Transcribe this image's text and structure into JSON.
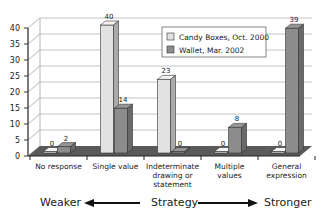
{
  "chart_data": {
    "type": "bar",
    "style": "3d-clustered-column",
    "title": "",
    "xlabel": "Strategy",
    "ylabel": "",
    "ylim": [
      0,
      40
    ],
    "yticks": [
      0,
      5,
      10,
      15,
      20,
      25,
      30,
      35,
      40
    ],
    "grid": true,
    "legend_position": "upper-right-inside",
    "categories": [
      "No response",
      "Single value",
      "Indeterminate drawing or statement",
      "Multiple values",
      "General expression"
    ],
    "category_label_lines": [
      [
        "No response"
      ],
      [
        "Single value"
      ],
      [
        "Indeterminate",
        "drawing or",
        "statement"
      ],
      [
        "Multiple",
        "values"
      ],
      [
        "General",
        "expression"
      ]
    ],
    "series": [
      {
        "name": "Candy Boxes, Oct. 2000",
        "color": "#e2e2e2",
        "values": [
          0,
          40,
          23,
          0,
          0
        ]
      },
      {
        "name": "Wallet, Mar. 2002",
        "color": "#8c8c8c",
        "values": [
          2,
          14,
          0,
          8,
          39
        ]
      }
    ],
    "annotations": {
      "left": "Weaker",
      "center": "Strategy",
      "right": "Stronger"
    }
  }
}
